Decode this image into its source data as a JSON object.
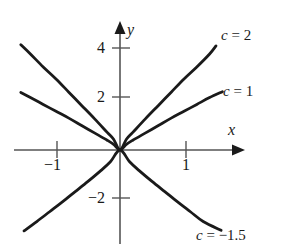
{
  "figure": {
    "title": "",
    "background_color": "#ffffff",
    "curve_color": "#1a1a1a",
    "axis_color": "#555555"
  },
  "axes": {
    "x_name": "x",
    "y_name": "y",
    "x_ticks": [
      {
        "value": -1,
        "label": "−1"
      },
      {
        "value": 1,
        "label": "1"
      }
    ],
    "y_ticks": [
      {
        "value": 4,
        "label": "4"
      },
      {
        "value": 2,
        "label": "2"
      },
      {
        "value": -2,
        "label": "−2"
      }
    ]
  },
  "curve_labels": {
    "c2": {
      "var": "c",
      "eq": " = 2"
    },
    "c1": {
      "var": "c",
      "eq": " = 1"
    },
    "cneg": {
      "var": "c",
      "eq": " = −1.5"
    }
  },
  "chart_data": {
    "type": "line",
    "title": "",
    "xlabel": "x",
    "ylabel": "y",
    "xlim": [
      -1.65,
      1.83
    ],
    "ylim": [
      -3.85,
      4.65
    ],
    "grid": false,
    "legend": "inline-curve-end-labels",
    "x_ticks": [
      -1,
      1
    ],
    "y_ticks": [
      4,
      2,
      -2
    ],
    "series": [
      {
        "name": "c = 2",
        "c": 2,
        "label": "c = 2",
        "color": "#1a1a1a",
        "points": [
          [
            -1.55,
            4.3
          ],
          [
            -1.4,
            3.92
          ],
          [
            -1.2,
            3.39
          ],
          [
            -1.0,
            2.9
          ],
          [
            -0.8,
            2.36
          ],
          [
            -0.6,
            1.82
          ],
          [
            -0.4,
            1.28
          ],
          [
            -0.2,
            0.72
          ],
          [
            -0.1,
            0.44
          ],
          [
            0.0,
            0.0
          ],
          [
            0.1,
            0.44
          ],
          [
            0.2,
            0.72
          ],
          [
            0.4,
            1.28
          ],
          [
            0.6,
            1.82
          ],
          [
            0.8,
            2.36
          ],
          [
            1.0,
            2.9
          ],
          [
            1.2,
            3.39
          ],
          [
            1.4,
            3.92
          ],
          [
            1.5,
            4.25
          ]
        ]
      },
      {
        "name": "c = 1",
        "c": 1,
        "label": "c = 1",
        "color": "#1a1a1a",
        "points": [
          [
            -1.55,
            2.35
          ],
          [
            -1.4,
            2.14
          ],
          [
            -1.2,
            1.86
          ],
          [
            -1.0,
            1.58
          ],
          [
            -0.8,
            1.3
          ],
          [
            -0.6,
            1.0
          ],
          [
            -0.4,
            0.7
          ],
          [
            -0.2,
            0.4
          ],
          [
            -0.1,
            0.23
          ],
          [
            0.0,
            0.0
          ],
          [
            0.1,
            0.23
          ],
          [
            0.2,
            0.4
          ],
          [
            0.4,
            0.7
          ],
          [
            0.6,
            1.0
          ],
          [
            0.8,
            1.3
          ],
          [
            1.0,
            1.58
          ],
          [
            1.2,
            1.86
          ],
          [
            1.4,
            2.14
          ],
          [
            1.6,
            2.38
          ]
        ]
      },
      {
        "name": "c = -1.5",
        "c": -1.5,
        "label": "c = −1.5",
        "color": "#1a1a1a",
        "points": [
          [
            -1.5,
            -3.3
          ],
          [
            -1.3,
            -2.92
          ],
          [
            -1.1,
            -2.52
          ],
          [
            -0.9,
            -2.12
          ],
          [
            -0.7,
            -1.7
          ],
          [
            -0.5,
            -1.28
          ],
          [
            -0.3,
            -0.84
          ],
          [
            -0.15,
            -0.48
          ],
          [
            0.0,
            0.0
          ],
          [
            0.15,
            -0.48
          ],
          [
            0.3,
            -0.84
          ],
          [
            0.5,
            -1.28
          ],
          [
            0.7,
            -1.7
          ],
          [
            0.9,
            -2.12
          ],
          [
            1.1,
            -2.52
          ],
          [
            1.3,
            -2.92
          ],
          [
            1.58,
            -3.28
          ]
        ]
      }
    ]
  }
}
